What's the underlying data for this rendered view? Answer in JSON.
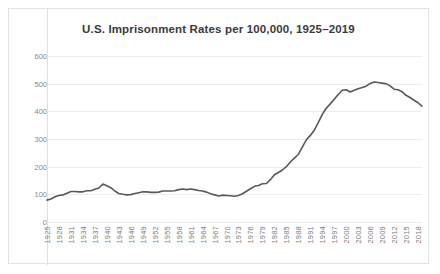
{
  "chart_data": {
    "type": "line",
    "title": "U.S. Imprisonment Rates per 100,000, 1925–2019",
    "xlabel": "",
    "ylabel": "",
    "ylim": [
      0,
      600
    ],
    "ytick_values": [
      0,
      100,
      200,
      300,
      400,
      500,
      600
    ],
    "ytick_labels": [
      "0",
      "100",
      "200",
      "300",
      "400",
      "500",
      "600"
    ],
    "xlim": [
      1925,
      2019
    ],
    "xtick_labels": [
      "1925",
      "1928",
      "1931",
      "1934",
      "1937",
      "1940",
      "1943",
      "1946",
      "1949",
      "1952",
      "1955",
      "1958",
      "1961",
      "1964",
      "1967",
      "1970",
      "1973",
      "1976",
      "1979",
      "1982",
      "1985",
      "1988",
      "1991",
      "1994",
      "1997",
      "2000",
      "2003",
      "2006",
      "2009",
      "2012",
      "2015",
      "2018"
    ],
    "xtick_step": 3,
    "grid": true,
    "grid_axis": "y",
    "legend": false,
    "line_color": "#595959",
    "line_width": 1.6,
    "series": [
      {
        "name": "U.S. imprisonment rate per 100,000",
        "x": [
          1925,
          1926,
          1927,
          1928,
          1929,
          1930,
          1931,
          1932,
          1933,
          1934,
          1935,
          1936,
          1937,
          1938,
          1939,
          1940,
          1941,
          1942,
          1943,
          1944,
          1945,
          1946,
          1947,
          1948,
          1949,
          1950,
          1951,
          1952,
          1953,
          1954,
          1955,
          1956,
          1957,
          1958,
          1959,
          1960,
          1961,
          1962,
          1963,
          1964,
          1965,
          1966,
          1967,
          1968,
          1969,
          1970,
          1971,
          1972,
          1973,
          1974,
          1975,
          1976,
          1977,
          1978,
          1979,
          1980,
          1981,
          1982,
          1983,
          1984,
          1985,
          1986,
          1987,
          1988,
          1989,
          1990,
          1991,
          1992,
          1993,
          1994,
          1995,
          1996,
          1997,
          1998,
          1999,
          2000,
          2001,
          2002,
          2003,
          2004,
          2005,
          2006,
          2007,
          2008,
          2009,
          2010,
          2011,
          2012,
          2013,
          2014,
          2015,
          2016,
          2017,
          2018,
          2019
        ],
        "values": [
          79,
          83,
          91,
          96,
          98,
          104,
          110,
          110,
          109,
          109,
          113,
          113,
          118,
          123,
          137,
          131,
          124,
          112,
          103,
          100,
          98,
          99,
          103,
          106,
          109,
          109,
          107,
          107,
          108,
          112,
          112,
          112,
          113,
          117,
          119,
          117,
          119,
          117,
          114,
          112,
          108,
          102,
          98,
          94,
          97,
          96,
          95,
          93,
          96,
          102,
          111,
          120,
          129,
          132,
          138,
          139,
          153,
          171,
          179,
          188,
          200,
          217,
          231,
          244,
          271,
          297,
          313,
          332,
          359,
          389,
          411,
          427,
          444,
          461,
          476,
          478,
          470,
          476,
          482,
          486,
          491,
          501,
          506,
          504,
          502,
          500,
          492,
          480,
          478,
          471,
          458,
          450,
          440,
          431,
          419
        ]
      }
    ]
  }
}
